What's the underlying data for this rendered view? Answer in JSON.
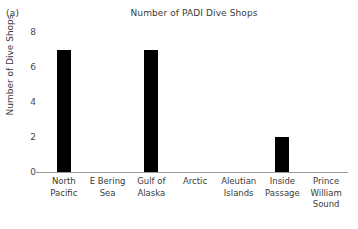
{
  "figure": {
    "panel_label": "(a)",
    "title": "Number of PADI Dive Shops"
  },
  "axes": {
    "ylabel": "Number of Dive Shops",
    "ytick_labels": [
      "0",
      "2",
      "4",
      "6",
      "8"
    ]
  },
  "colors": {
    "bar": "#000000",
    "axis": "#9a9a9a",
    "text": "#3a3a3a"
  },
  "chart_data": {
    "type": "bar",
    "title": "Number of PADI Dive Shops",
    "xlabel": "",
    "ylabel": "Number of Dive Shops",
    "ylim": [
      0,
      8
    ],
    "yticks": [
      0,
      2,
      4,
      6,
      8
    ],
    "grid": false,
    "legend": false,
    "categories": [
      "North Pacific",
      "E Bering Sea",
      "Gulf of Alaska",
      "Arctic",
      "Aleutian Islands",
      "Inside Passage",
      "Prince William Sound"
    ],
    "category_lines": [
      [
        "North",
        "Pacific"
      ],
      [
        "E Bering",
        "Sea"
      ],
      [
        "Gulf of",
        "Alaska"
      ],
      [
        "Arctic"
      ],
      [
        "Aleutian",
        "Islands"
      ],
      [
        "Inside",
        "Passage"
      ],
      [
        "Prince",
        "William",
        "Sound"
      ]
    ],
    "values": [
      7,
      0,
      7,
      0,
      0,
      2,
      0
    ]
  }
}
